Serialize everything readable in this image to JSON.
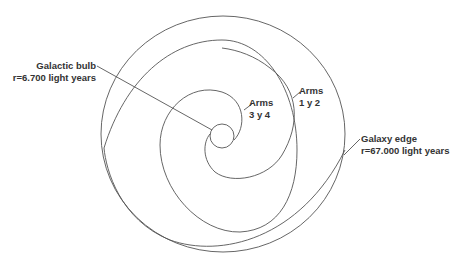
{
  "diagram": {
    "type": "spiral-galaxy-schematic",
    "stroke_color": "#555555",
    "text_color": "#333333",
    "background": "#ffffff"
  },
  "labels": {
    "bulb": {
      "line1": "Galactic bulb",
      "line2": "r=6.700 light years"
    },
    "arms_inner": {
      "line1": "Arms",
      "line2": "3 y 4"
    },
    "arms_outer": {
      "line1": "Arms",
      "line2": "1 y 2"
    },
    "edge": {
      "line1": "Galaxy edge",
      "line2": "r=67.000 light years"
    }
  }
}
